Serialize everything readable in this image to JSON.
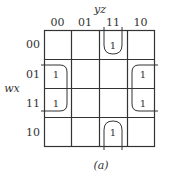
{
  "kmap": {
    "col_var": "yz",
    "row_var": "wx",
    "col_labels": [
      "00",
      "01",
      "11",
      "10"
    ],
    "row_labels": [
      "00",
      "01",
      "11",
      "10"
    ],
    "cells": [
      [
        "",
        "",
        "1",
        ""
      ],
      [
        "1",
        "",
        "",
        "1"
      ],
      [
        "1",
        "",
        "",
        "1"
      ],
      [
        "",
        "",
        "1",
        ""
      ]
    ],
    "caption": "(a)"
  }
}
